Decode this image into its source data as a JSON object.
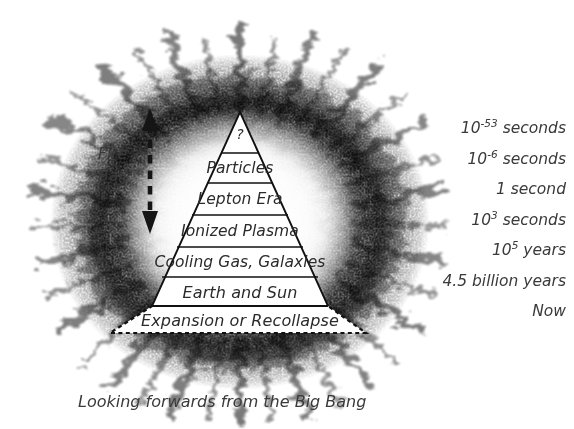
{
  "diagram": {
    "caption": "Looking forwards from the Big Bang",
    "fireball": {
      "line1": "Fire",
      "line2": "Ball",
      "arrow_name": "double-headed-dashed-arrow"
    },
    "apex_symbol": "?",
    "layers": [
      {
        "label": "?",
        "time_base": "10",
        "time_exp": "-53",
        "time_unit": "seconds"
      },
      {
        "label": "Particles",
        "time_base": "10",
        "time_exp": "-6",
        "time_unit": "seconds"
      },
      {
        "label": "Lepton Era",
        "time_base": "1",
        "time_exp": "",
        "time_unit": "second"
      },
      {
        "label": "Ionized Plasma",
        "time_base": "10",
        "time_exp": "3",
        "time_unit": "seconds"
      },
      {
        "label": "Cooling Gas, Galaxies",
        "time_base": "10",
        "time_exp": "5",
        "time_unit": "years"
      },
      {
        "label": "Earth and Sun",
        "time_base": "4.5 billion",
        "time_exp": "",
        "time_unit": "years"
      },
      {
        "label": "Expansion or Recollapse",
        "time_base": "Now",
        "time_exp": "",
        "time_unit": ""
      }
    ],
    "times": [
      {
        "text": "10⁻⁵³ seconds",
        "base": "10",
        "exp": "-53",
        "unit": "seconds"
      },
      {
        "text": "10⁻⁶ seconds",
        "base": "10",
        "exp": "-6",
        "unit": "seconds"
      },
      {
        "text": "1 second",
        "base": "1",
        "exp": "",
        "unit": "second"
      },
      {
        "text": "10³ seconds",
        "base": "10",
        "exp": "3",
        "unit": "seconds"
      },
      {
        "text": "10⁵ years",
        "base": "10",
        "exp": "5",
        "unit": "years"
      },
      {
        "text": "4.5 billion years",
        "base": "4.5 billion",
        "exp": "",
        "unit": "years"
      },
      {
        "text": "Now",
        "base": "Now",
        "exp": "",
        "unit": ""
      }
    ],
    "colors": {
      "ink": "#2b2b2b",
      "line": "#1a1a1a",
      "background": "#ffffff",
      "layer_fill": "#ffffff",
      "explosion": "#000000"
    }
  }
}
